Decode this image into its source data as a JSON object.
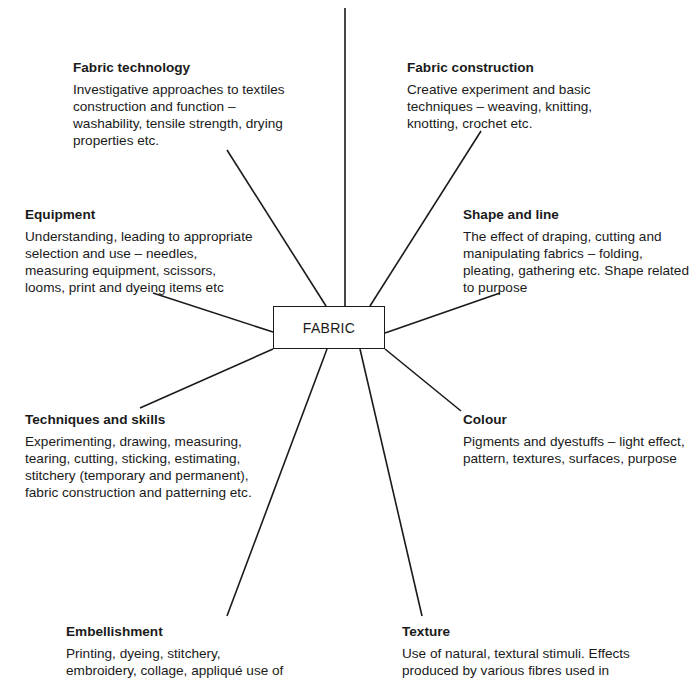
{
  "center": {
    "label": "FABRIC"
  },
  "nodes": [
    {
      "id": "fabric-technology",
      "title": "Fabric technology",
      "body": "Investigative approaches to textiles\nconstruction and function –\nwashability, tensile strength, drying\nproperties etc."
    },
    {
      "id": "fabric-construction",
      "title": "Fabric construction",
      "body": "Creative experiment and basic\ntechniques – weaving, knitting,\nknotting, crochet etc."
    },
    {
      "id": "equipment",
      "title": "Equipment",
      "body": "Understanding, leading to appropriate\nselection and use – needles,\nmeasuring equipment, scissors,\nlooms, print and dyeing items etc"
    },
    {
      "id": "shape-and-line",
      "title": "Shape and line",
      "body": "The effect of draping, cutting and\nmanipulating fabrics – folding,\npleating, gathering etc. Shape related\nto purpose"
    },
    {
      "id": "techniques-and-skills",
      "title": "Techniques and skills",
      "body": "Experimenting, drawing, measuring,\ntearing, cutting, sticking, estimating,\nstitchery (temporary and permanent),\nfabric construction and patterning etc."
    },
    {
      "id": "colour",
      "title": "Colour",
      "body": "Pigments and dyestuffs – light effect,\npattern, textures, surfaces, purpose"
    },
    {
      "id": "embellishment",
      "title": "Embellishment",
      "body": "Printing, dyeing, stitchery,\nembroidery, collage, appliqué use of"
    },
    {
      "id": "texture",
      "title": "Texture",
      "body": "Use of natural, textural stimuli. Effects\nproduced by various fibres used in"
    }
  ],
  "colors": {
    "line": "#1a1a1a",
    "text": "#1a1a1a",
    "background": "#ffffff"
  }
}
